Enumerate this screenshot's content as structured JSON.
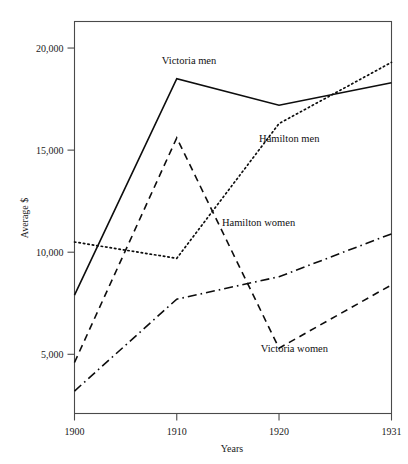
{
  "chart_data": {
    "type": "line",
    "title": "",
    "subtitle": "",
    "xlabel": "Years",
    "ylabel": "Average $",
    "x": [
      1900,
      1910,
      1920,
      1931
    ],
    "xtick_labels": [
      "1900",
      "1910",
      "1920",
      "1931"
    ],
    "ytick_values": [
      5000,
      10000,
      15000,
      20000
    ],
    "ytick_labels": [
      "5,000",
      "10,000",
      "15,000",
      "20,000"
    ],
    "xlim": [
      1900,
      1931
    ],
    "ylim": [
      2100,
      21300
    ],
    "grid": false,
    "legend_position": "inline-annotations",
    "series": [
      {
        "name": "Victoria men",
        "linestyle": "solid",
        "color": "#0d0d0d",
        "values": [
          7900,
          18500,
          17200,
          18300
        ],
        "label_text": "Victoria men",
        "label_x": 1911.2,
        "label_y": 19200
      },
      {
        "name": "Hamilton men",
        "linestyle": "dotted",
        "color": "#0d0d0d",
        "values": [
          10500,
          9700,
          16300,
          19300
        ],
        "label_text": "Hamilton men",
        "label_x": 1921.0,
        "label_y": 15400
      },
      {
        "name": "Hamilton women",
        "linestyle": "dashdot",
        "color": "#0d0d0d",
        "values": [
          3200,
          7700,
          8800,
          10900
        ],
        "label_text": "Hamilton women",
        "label_x": 1918.0,
        "label_y": 11300
      },
      {
        "name": "Victoria women",
        "linestyle": "dashed",
        "color": "#0d0d0d",
        "values": [
          4600,
          15600,
          5300,
          8400
        ],
        "label_text": "Victoria women",
        "label_x": 1921.5,
        "label_y": 5100
      }
    ]
  },
  "axes": {
    "xlabel": "Years",
    "ylabel": "Average $"
  }
}
